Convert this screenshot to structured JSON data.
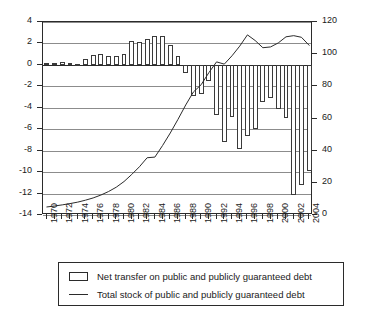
{
  "chart_data": {
    "type": "bar",
    "title": "",
    "subtitle": "",
    "xlabel": "",
    "ylabel": "",
    "y2label": "",
    "grid": true,
    "legend_position": "bottom",
    "x": [
      1970,
      1971,
      1972,
      1973,
      1974,
      1975,
      1976,
      1977,
      1978,
      1979,
      1980,
      1981,
      1982,
      1983,
      1984,
      1985,
      1986,
      1987,
      1988,
      1989,
      1990,
      1991,
      1992,
      1993,
      1994,
      1995,
      1996,
      1997,
      1998,
      1999,
      2000,
      2001,
      2002,
      2003,
      2004
    ],
    "categories": [
      "1970",
      "1971",
      "1972",
      "1973",
      "1974",
      "1975",
      "1976",
      "1977",
      "1978",
      "1979",
      "1980",
      "1981",
      "1982",
      "1983",
      "1984",
      "1985",
      "1986",
      "1987",
      "1988",
      "1989",
      "1990",
      "1991",
      "1992",
      "1993",
      "1994",
      "1995",
      "1996",
      "1997",
      "1998",
      "1999",
      "2000",
      "2001",
      "2002",
      "2003",
      "2004"
    ],
    "xlim": [
      1969.5,
      2004.5
    ],
    "xticks": [
      1970,
      1971,
      1972,
      1973,
      1974,
      1975,
      1976,
      1977,
      1978,
      1979,
      1980,
      1981,
      1982,
      1983,
      1984,
      1985,
      1986,
      1987,
      1988,
      1989,
      1990,
      1991,
      1992,
      1993,
      1994,
      1995,
      1996,
      1997,
      1998,
      1999,
      2000,
      2001,
      2002,
      2003,
      2004
    ],
    "xticklabels": [
      "1970",
      "",
      "1972",
      "",
      "1974",
      "",
      "1976",
      "",
      "1978",
      "",
      "1980",
      "",
      "1982",
      "",
      "1984",
      "",
      "1986",
      "",
      "1988",
      "",
      "1990",
      "",
      "1992",
      "",
      "1994",
      "",
      "1996",
      "",
      "1998",
      "",
      "2000",
      "",
      "2002",
      "",
      "2004"
    ],
    "ylim": [
      -14,
      4
    ],
    "yticks": [
      4,
      2,
      0,
      -2,
      -4,
      -6,
      -8,
      -10,
      -12,
      -14
    ],
    "yticklabels": [
      "4",
      "2",
      "0",
      "-2",
      "-4",
      "-6",
      "-8",
      "-10",
      "-12",
      "-14"
    ],
    "y2lim": [
      0,
      120
    ],
    "y2ticks": [
      120,
      100,
      80,
      60,
      40,
      20,
      0
    ],
    "y2ticklabels": [
      "120",
      "100",
      "80",
      "60",
      "40",
      "20",
      "0"
    ],
    "series": [
      {
        "name": "Net transfer on public and publicly guaranteed debt",
        "type": "bar",
        "axis": "left",
        "values": [
          0.2,
          0.2,
          0.25,
          0.15,
          0.1,
          0.55,
          0.9,
          1.0,
          0.8,
          0.8,
          1.0,
          2.25,
          2.1,
          2.4,
          2.7,
          2.7,
          1.85,
          0.85,
          -0.8,
          -2.9,
          -2.7,
          -1.5,
          -4.7,
          -7.2,
          -4.9,
          -7.8,
          -6.6,
          -6.0,
          -3.5,
          -3.1,
          -4.1,
          -5.0,
          -12.1,
          -11.2,
          -9.9
        ]
      },
      {
        "name": "Total stock of public and publicly guaranteed debt",
        "type": "line",
        "axis": "right",
        "values": [
          5.0,
          5.6,
          6.3,
          7.1,
          8.0,
          9.2,
          10.6,
          12.4,
          14.6,
          17.3,
          20.8,
          25.2,
          30.0,
          35.6,
          36.0,
          43.2,
          51.0,
          59.5,
          68.4,
          76.5,
          81.0,
          88.5,
          95.2,
          93.8,
          99.0,
          105.0,
          112.0,
          108.5,
          104.0,
          104.5,
          107.0,
          110.8,
          111.5,
          110.5,
          105.5
        ]
      }
    ]
  },
  "legend": {
    "items": [
      {
        "marker": "box",
        "label": "Net transfer on public and publicly guaranteed debt"
      },
      {
        "marker": "line",
        "label": "Total stock of public and publicly guaranteed debt"
      }
    ]
  }
}
